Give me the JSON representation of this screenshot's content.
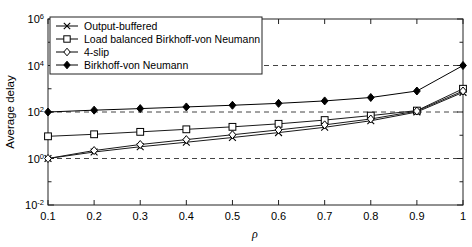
{
  "chart_data": {
    "type": "line",
    "title": "",
    "xlabel": "ρ",
    "ylabel": "Average delay",
    "yscale": "log",
    "xscale": "linear",
    "xlim": [
      0.1,
      1.0
    ],
    "ylim": [
      0.01,
      1000000
    ],
    "grid": true,
    "grid_lines_y": [
      1,
      100,
      10000
    ],
    "legend_position": "top-left",
    "xticks": [
      0.1,
      0.2,
      0.3,
      0.4,
      0.5,
      0.6,
      0.7,
      0.8,
      0.9,
      1
    ],
    "xticklabels": [
      "0.1",
      "0.2",
      "0.3",
      "0.4",
      "0.5",
      "0.6",
      "0.7",
      "0.8",
      "0.9",
      "1"
    ],
    "yticks": [
      0.01,
      1,
      100,
      10000,
      1000000
    ],
    "yticklabels": [
      "10⁻²",
      "10⁰",
      "10²",
      "10⁴",
      "10⁶"
    ],
    "x": [
      0.1,
      0.2,
      0.3,
      0.4,
      0.5,
      0.6,
      0.7,
      0.8,
      0.9,
      1.0
    ],
    "series": [
      {
        "name": "Output-buffered",
        "marker": "x-mark",
        "color": "#1a1a1a",
        "filled": false,
        "values": [
          1.0,
          1.9,
          3.2,
          5.0,
          8.0,
          13.0,
          22.0,
          42.0,
          100.0,
          700.0
        ]
      },
      {
        "name": "Load balanced Birkhoff-von Neumann",
        "marker": "square",
        "color": "#1a1a1a",
        "filled": false,
        "values": [
          9.0,
          11.0,
          14.0,
          18.0,
          23.0,
          31.0,
          45.0,
          70.0,
          115.0,
          1000.0
        ]
      },
      {
        "name": "4-slip",
        "marker": "diamond",
        "color": "#1a1a1a",
        "filled": false,
        "values": [
          1.0,
          2.2,
          4.0,
          6.5,
          10.5,
          17.0,
          28.0,
          50.0,
          110.0,
          800.0
        ]
      },
      {
        "name": "Birkhoff-von Neumann",
        "marker": "filled-diamond",
        "color": "#000000",
        "filled": true,
        "values": [
          100.0,
          120.0,
          140.0,
          165.0,
          195.0,
          235.0,
          300.0,
          420.0,
          800.0,
          10000.0
        ]
      }
    ]
  },
  "axes": {
    "ylabel": "Average delay",
    "xlabel": "ρ",
    "ytick_labels": [
      {
        "base": "10",
        "exp": "6"
      },
      {
        "base": "10",
        "exp": "4"
      },
      {
        "base": "10",
        "exp": "2"
      },
      {
        "base": "10",
        "exp": "0"
      },
      {
        "base": "10",
        "exp": "-2"
      }
    ],
    "xtick_labels": [
      "0.1",
      "0.2",
      "0.3",
      "0.4",
      "0.5",
      "0.6",
      "0.7",
      "0.8",
      "0.9",
      "1"
    ]
  },
  "legend": {
    "items": [
      {
        "label": "Output-buffered",
        "marker": "x-mark"
      },
      {
        "label": "Load balanced Birkhoff-von Neumann",
        "marker": "square"
      },
      {
        "label": "4-slip",
        "marker": "diamond"
      },
      {
        "label": "Birkhoff-von Neumann",
        "marker": "filled-diamond"
      }
    ]
  },
  "style": {
    "axis_color": "#222222",
    "grid_color": "#444444",
    "background": "#ffffff"
  }
}
